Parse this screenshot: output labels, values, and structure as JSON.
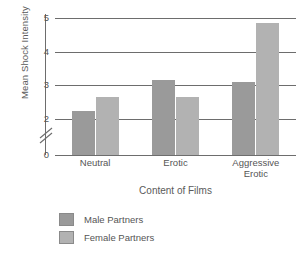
{
  "chart_data": {
    "type": "bar",
    "title": "",
    "xlabel": "Content of Films",
    "ylabel": "Mean Shock Intensity",
    "categories": [
      "Neutral",
      "Erotic",
      "Aggressive Erotic"
    ],
    "series": [
      {
        "name": "Male Partners",
        "color": "#9a9a9a",
        "values": [
          2.25,
          3.15,
          3.1
        ]
      },
      {
        "name": "Female Partners",
        "color": "#b2b2b2",
        "values": [
          2.65,
          2.65,
          4.85
        ]
      }
    ],
    "ylim": [
      0,
      5.3
    ],
    "yticks": [
      "0",
      "2",
      "3",
      "4",
      "5"
    ],
    "ytick_values": [
      0,
      2,
      3,
      4,
      5
    ],
    "axis_break": true,
    "axis_break_between": [
      0,
      2
    ],
    "grid": "horizontal",
    "legend_position": "bottom-left"
  },
  "xticks": [
    {
      "label": "Neutral"
    },
    {
      "label": "Erotic"
    },
    {
      "label": "Aggressive\nErotic"
    }
  ],
  "legend": {
    "items": [
      {
        "label": "Male Partners"
      },
      {
        "label": "Female Partners"
      }
    ]
  }
}
